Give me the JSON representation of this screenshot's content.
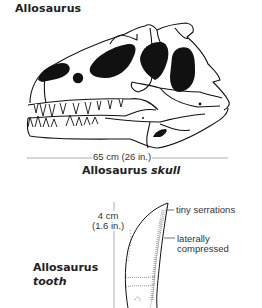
{
  "title": "Allosaurus",
  "skull": {
    "scale_label": "65 cm (26 in.)",
    "caption_name": "Allosaurus",
    "caption_part": "skull"
  },
  "tooth": {
    "height_label_line1": "4 cm",
    "height_label_line2": "(1.6 in.)",
    "annotations": [
      {
        "label": "tiny serrations"
      },
      {
        "label_line1": "laterally",
        "label_line2": "compressed"
      }
    ],
    "caption_name": "Allosaurus",
    "caption_part": "tooth"
  },
  "colors": {
    "ink": "#111111",
    "scale_line": "#999999",
    "text": "#333333"
  }
}
